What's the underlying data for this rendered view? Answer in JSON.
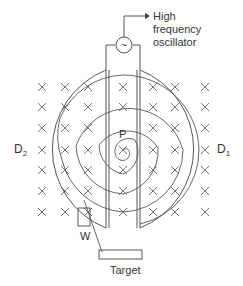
{
  "diagram": {
    "type": "cyclotron",
    "labels": {
      "oscillator_line1": "High",
      "oscillator_line2": "frequency",
      "oscillator_line3": "oscillator",
      "dee_left": "D",
      "dee_left_sub": "2",
      "dee_right": "D",
      "dee_right_sub": "1",
      "source": "P",
      "window": "W",
      "target": "Target"
    },
    "oscillator_symbol": "~",
    "colors": {
      "stroke": "#555555",
      "text": "#333333",
      "background": "#ffffff"
    }
  }
}
